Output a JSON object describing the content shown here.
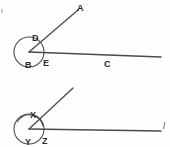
{
  "figure": {
    "stroke_color": "#4a4a4a",
    "label_color": "#2a2a2a",
    "background": "#fefefe",
    "figures": [
      {
        "name": "upper-angle-figure",
        "vertex": {
          "x": 29,
          "y": 52
        },
        "circle": {
          "cx": 29,
          "cy": 52,
          "r": 15
        },
        "rays": [
          {
            "name": "ray-to-A",
            "x1": 29,
            "y1": 52,
            "x2": 78,
            "y2": 10
          },
          {
            "name": "ray-to-C",
            "x1": 29,
            "y1": 52,
            "x2": 161,
            "y2": 57
          }
        ],
        "labels": [
          {
            "id": "A",
            "text": "A",
            "x": 77,
            "y": 4
          },
          {
            "id": "D",
            "text": "D",
            "x": 32,
            "y": 34
          },
          {
            "id": "B",
            "text": "B",
            "x": 25,
            "y": 61
          },
          {
            "id": "E",
            "text": "E",
            "x": 43,
            "y": 59
          },
          {
            "id": "C",
            "text": "C",
            "x": 104,
            "y": 60
          }
        ]
      },
      {
        "name": "lower-angle-figure",
        "vertex": {
          "x": 29,
          "y": 129
        },
        "circle": {
          "cx": 29,
          "cy": 129,
          "r": 15
        },
        "rays": [
          {
            "name": "ray-upper-left-slant",
            "x1": 29,
            "y1": 129,
            "x2": 73,
            "y2": 88
          },
          {
            "name": "ray-to-l",
            "x1": 29,
            "y1": 129,
            "x2": 161,
            "y2": 131
          }
        ],
        "arc_mark": {
          "name": "angle-arc-mark",
          "cx": 29,
          "cy": 129,
          "r": 14
        },
        "labels": [
          {
            "id": "X",
            "text": "X",
            "x": 30,
            "y": 111
          },
          {
            "id": "Y",
            "text": "Y",
            "x": 25,
            "y": 138
          },
          {
            "id": "Z",
            "text": "Z",
            "x": 42,
            "y": 137
          },
          {
            "id": "l",
            "text": "l",
            "x": 163,
            "y": 122
          }
        ]
      }
    ],
    "speck": {
      "x": 1,
      "y": 9,
      "w": 2,
      "h": 4
    }
  }
}
